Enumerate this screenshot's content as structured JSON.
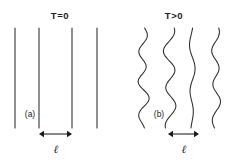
{
  "figure": {
    "background_color": "#ffffff",
    "ink_color": "#2b2b2b",
    "width": 227,
    "height": 163
  },
  "panels": [
    {
      "id": "a",
      "tag": "(a)",
      "title": "T=0",
      "title_x": 60,
      "title_y": 19,
      "tag_x": 30,
      "tag_y": 117,
      "description": "straight-vertical-lines",
      "lines": [
        {
          "x": 15,
          "y_top": 28,
          "y_bottom": 128,
          "amplitude": 0
        },
        {
          "x": 39,
          "y_top": 28,
          "y_bottom": 128,
          "amplitude": 0
        },
        {
          "x": 72,
          "y_top": 28,
          "y_bottom": 128,
          "amplitude": 0
        },
        {
          "x": 97,
          "y_top": 28,
          "y_bottom": 128,
          "amplitude": 0
        }
      ],
      "dimension": {
        "label": "ℓ",
        "x_start": 39,
        "x_end": 72,
        "y": 134,
        "label_x": 56,
        "label_y": 153
      }
    },
    {
      "id": "b",
      "tag": "(b)",
      "title": "T>0",
      "title_x": 174,
      "title_y": 19,
      "tag_x": 159,
      "tag_y": 117,
      "description": "wavy-fluctuating-lines",
      "lines": [
        {
          "x": 143,
          "y_top": 28,
          "y_bottom": 128,
          "amplitude": 6.5,
          "phase": 0.35,
          "waves": 3.1
        },
        {
          "x": 170,
          "y_top": 28,
          "y_bottom": 128,
          "amplitude": 8.0,
          "phase": 1.15,
          "waves": 2.6
        },
        {
          "x": 192,
          "y_top": 28,
          "y_bottom": 128,
          "amplitude": 3.2,
          "phase": 2.4,
          "waves": 2.2
        },
        {
          "x": 216,
          "y_top": 28,
          "y_bottom": 128,
          "amplitude": 5.5,
          "phase": 0.95,
          "waves": 2.8
        }
      ],
      "dimension": {
        "label": "ℓ",
        "x_start": 168,
        "x_end": 199,
        "y": 134,
        "label_x": 184,
        "label_y": 153
      }
    }
  ]
}
